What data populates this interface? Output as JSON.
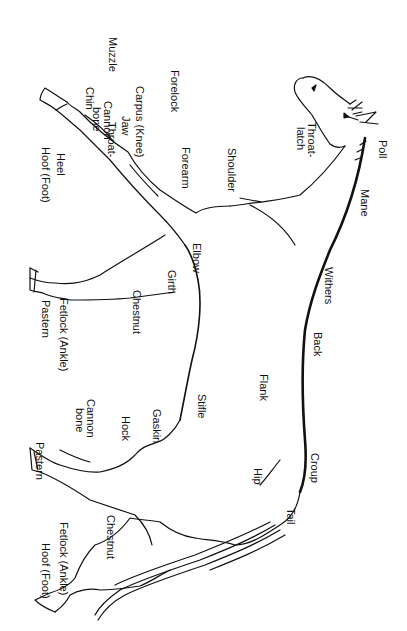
{
  "diagram": {
    "orientation": "rotated 90° clockwise",
    "labels": {
      "muzzle": "Muzzle",
      "forelock": "Forelock",
      "chin": "Chin",
      "jaw": "Jaw",
      "throatlatch": "Throat-\nlatch",
      "throatlatch_1": "Throat-",
      "throatlatch_2": "latch",
      "poll": "Poll",
      "mane": "Mane",
      "shoulder": "Shoulder",
      "forearm": "Forearm",
      "carpus": "Carpus  (Knee)",
      "cannon_front_1": "Cannon",
      "cannon_front_2": "bone",
      "heel": "Heel",
      "hoof_front": "Hoof  (Foot)",
      "elbow": "Elbow",
      "withers": "Withers",
      "girth": "Girth",
      "chestnut_front": "Chestnut",
      "pastern_front": "Pastern",
      "fetlock_front": "Fetlock  (Ankle)",
      "back": "Back",
      "flank": "Flank",
      "stifle": "Stifle",
      "gaskin": "Gaskin",
      "hock": "Hock",
      "cannon_hind_1": "Cannon",
      "cannon_hind_2": "bone",
      "pastern_hind": "Pastern",
      "croup": "Croup",
      "hip": "Hip",
      "tail": "Tail",
      "chestnut_hind": "Chestnut",
      "fetlock_hind": "Fetlock  (Ankle)",
      "hoof_hind": "Hoof  (Foot)"
    }
  }
}
